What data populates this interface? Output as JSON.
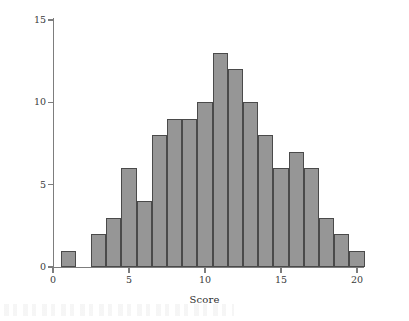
{
  "figure": {
    "background_color": "#ffffff",
    "bar_fill_color": "#969696",
    "bar_edge_color": "#4a4a4a",
    "axis_color": "#7d7d7d"
  },
  "chart_data": {
    "type": "bar",
    "subtype": "histogram",
    "title": "",
    "xlabel": "Score",
    "ylabel": "Frequency",
    "xlim": [
      -0.6,
      21.0
    ],
    "ylim": [
      0,
      15.8
    ],
    "xticks": [
      0,
      5,
      10,
      15,
      20
    ],
    "xtick_labels": [
      "0",
      "5",
      "10",
      "15",
      "20"
    ],
    "yticks": [
      0,
      5,
      10,
      15
    ],
    "ytick_labels": [
      "0",
      "5",
      "10",
      "15"
    ],
    "grid": false,
    "legend": null,
    "bin_width": 1,
    "bin_edges": [
      0.5,
      1.5,
      2.5,
      3.5,
      4.5,
      5.5,
      6.5,
      7.5,
      8.5,
      9.5,
      10.5,
      11.5,
      12.5,
      13.5,
      14.5,
      15.5,
      16.5,
      17.5,
      18.5,
      19.5,
      20.5
    ],
    "bin_centers": [
      1,
      2,
      3,
      4,
      5,
      6,
      7,
      8,
      9,
      10,
      11,
      12,
      13,
      14,
      15,
      16,
      17,
      18,
      19,
      20
    ],
    "categories": [
      "1",
      "2",
      "3",
      "4",
      "5",
      "6",
      "7",
      "8",
      "9",
      "10",
      "11",
      "12",
      "13",
      "14",
      "15",
      "16",
      "17",
      "18",
      "19",
      "20"
    ],
    "values": [
      1,
      0,
      2,
      3,
      6,
      4,
      8,
      9,
      9,
      10,
      13,
      12,
      10,
      8,
      6,
      7,
      6,
      3,
      2,
      1
    ],
    "total_count": 130
  }
}
